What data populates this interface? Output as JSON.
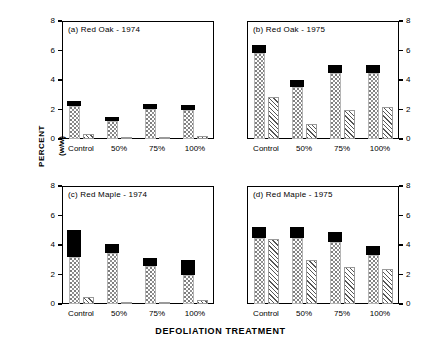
{
  "figure": {
    "ylabel_line1": "PERCENT",
    "ylabel_line2": "(w/w)",
    "xlabel": "DEFOLIATION TREATMENT",
    "categories": [
      "Control",
      "50%",
      "75%",
      "100%"
    ],
    "yticks": [
      "0",
      "2",
      "4",
      "6",
      "8"
    ],
    "ytick_values": [
      0,
      2,
      4,
      6,
      8
    ],
    "ylim": [
      0,
      8
    ],
    "colors": {
      "solid": "#000000",
      "stipple": "#8f8f8f",
      "hatch": "#555555",
      "axis": "#000000",
      "background": "#ffffff"
    }
  },
  "chart_data": [
    {
      "type": "bar",
      "panel": "a",
      "title": "(a) Red Oak - 1974",
      "categories": [
        "Control",
        "50%",
        "75%",
        "100%"
      ],
      "xlabel": "",
      "ylabel": "PERCENT (w/w)",
      "ylim": [
        0,
        8
      ],
      "yticks": [
        0,
        2,
        4,
        6,
        8
      ],
      "grid": false,
      "legend": "none",
      "series": [
        {
          "name": "bar1-stippled-lower",
          "fill": "stipple",
          "values": [
            2.25,
            1.25,
            2.05,
            2.0
          ]
        },
        {
          "name": "bar1-solid-cap",
          "fill": "solid",
          "values": [
            0.3,
            0.25,
            0.3,
            0.3
          ]
        },
        {
          "name": "bar1-total",
          "fill": "total",
          "values": [
            2.55,
            1.5,
            2.35,
            2.3
          ]
        },
        {
          "name": "bar2-hatched",
          "fill": "hatch",
          "values": [
            0.35,
            0.1,
            0.1,
            0.2
          ]
        }
      ]
    },
    {
      "type": "bar",
      "panel": "b",
      "title": "(b) Red Oak - 1975",
      "categories": [
        "Control",
        "50%",
        "75%",
        "100%"
      ],
      "xlabel": "",
      "ylabel": "PERCENT (w/w)",
      "ylim": [
        0,
        8
      ],
      "yticks": [
        0,
        2,
        4,
        6,
        8
      ],
      "grid": false,
      "legend": "none",
      "series": [
        {
          "name": "bar1-stippled-lower",
          "fill": "stipple",
          "values": [
            5.85,
            3.55,
            4.45,
            4.45
          ]
        },
        {
          "name": "bar1-solid-cap",
          "fill": "solid",
          "values": [
            0.55,
            0.45,
            0.55,
            0.55
          ]
        },
        {
          "name": "bar1-total",
          "fill": "total",
          "values": [
            6.4,
            4.0,
            5.0,
            5.0
          ]
        },
        {
          "name": "bar2-hatched",
          "fill": "hatch",
          "values": [
            2.85,
            1.0,
            2.0,
            2.2
          ]
        }
      ]
    },
    {
      "type": "bar",
      "panel": "c",
      "title": "(c) Red Maple - 1974",
      "categories": [
        "Control",
        "50%",
        "75%",
        "100%"
      ],
      "xlabel": "",
      "ylabel": "PERCENT (w/w)",
      "ylim": [
        0,
        8
      ],
      "yticks": [
        0,
        2,
        4,
        6,
        8
      ],
      "grid": false,
      "legend": "none",
      "series": [
        {
          "name": "bar1-stippled-lower",
          "fill": "stipple",
          "values": [
            3.2,
            3.45,
            2.6,
            2.0
          ]
        },
        {
          "name": "bar1-solid-cap",
          "fill": "solid",
          "values": [
            1.8,
            0.6,
            0.5,
            1.0
          ]
        },
        {
          "name": "bar1-total",
          "fill": "total",
          "values": [
            5.0,
            4.05,
            3.1,
            3.0
          ]
        },
        {
          "name": "bar2-hatched",
          "fill": "hatch",
          "values": [
            0.5,
            0.1,
            0.1,
            0.3
          ]
        }
      ]
    },
    {
      "type": "bar",
      "panel": "d",
      "title": "(d) Red Maple - 1975",
      "categories": [
        "Control",
        "50%",
        "75%",
        "100%"
      ],
      "xlabel": "",
      "ylabel": "PERCENT (w/w)",
      "ylim": [
        0,
        8
      ],
      "yticks": [
        0,
        2,
        4,
        6,
        8
      ],
      "grid": false,
      "legend": "none",
      "series": [
        {
          "name": "bar1-stippled-lower",
          "fill": "stipple",
          "values": [
            4.45,
            4.45,
            4.2,
            3.3
          ]
        },
        {
          "name": "bar1-solid-cap",
          "fill": "solid",
          "values": [
            0.75,
            0.75,
            0.7,
            0.6
          ]
        },
        {
          "name": "bar1-total",
          "fill": "total",
          "values": [
            5.2,
            5.2,
            4.9,
            3.9
          ]
        },
        {
          "name": "bar2-hatched",
          "fill": "hatch",
          "values": [
            4.4,
            3.0,
            2.5,
            2.4
          ]
        }
      ]
    }
  ]
}
